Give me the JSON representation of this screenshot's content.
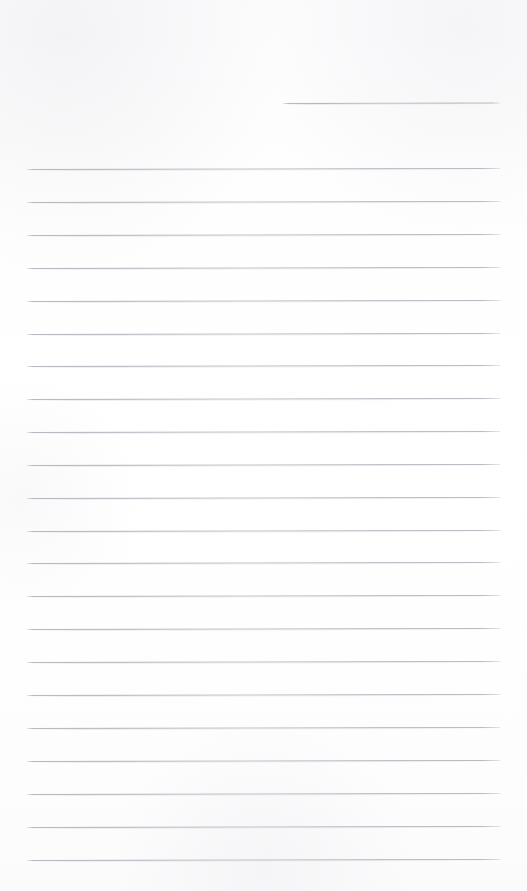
{
  "document": {
    "type": "lined-notepad-page",
    "title": "Blank ruled notepad page",
    "orientation": "portrait",
    "page_width": 527,
    "page_height": 891,
    "background_color": "#fdfdfd",
    "rule_color": "#b9bdc3",
    "rule_thickness_px": 1,
    "rule_spacing_px": 32.9,
    "has_text_content": false,
    "has_margin_rule": false,
    "body_text": "",
    "header_line_label": "",
    "scan_skew_degrees": -0.12
  },
  "rules": {
    "header_rule": {
      "name": "header-blank-rule",
      "x_start": 283,
      "x_end": 500,
      "y": 103,
      "width": 217,
      "value": ""
    },
    "body_rule_geometry": {
      "x_start": 27,
      "x_end": 500,
      "width": 473,
      "first_y": 169,
      "spacing": 32.9,
      "count": 22
    },
    "body_rules": [
      {
        "index": 1,
        "y": 169,
        "value": ""
      },
      {
        "index": 2,
        "y": 202,
        "value": ""
      },
      {
        "index": 3,
        "y": 235,
        "value": ""
      },
      {
        "index": 4,
        "y": 268,
        "value": ""
      },
      {
        "index": 5,
        "y": 301,
        "value": ""
      },
      {
        "index": 6,
        "y": 334,
        "value": ""
      },
      {
        "index": 7,
        "y": 366,
        "value": ""
      },
      {
        "index": 8,
        "y": 399,
        "value": ""
      },
      {
        "index": 9,
        "y": 432,
        "value": ""
      },
      {
        "index": 10,
        "y": 465,
        "value": ""
      },
      {
        "index": 11,
        "y": 498,
        "value": ""
      },
      {
        "index": 12,
        "y": 531,
        "value": ""
      },
      {
        "index": 13,
        "y": 563,
        "value": ""
      },
      {
        "index": 14,
        "y": 596,
        "value": ""
      },
      {
        "index": 15,
        "y": 629,
        "value": ""
      },
      {
        "index": 16,
        "y": 662,
        "value": ""
      },
      {
        "index": 17,
        "y": 695,
        "value": ""
      },
      {
        "index": 18,
        "y": 728,
        "value": ""
      },
      {
        "index": 19,
        "y": 761,
        "value": ""
      },
      {
        "index": 20,
        "y": 794,
        "value": ""
      },
      {
        "index": 21,
        "y": 827,
        "value": ""
      },
      {
        "index": 22,
        "y": 860,
        "value": ""
      }
    ]
  }
}
